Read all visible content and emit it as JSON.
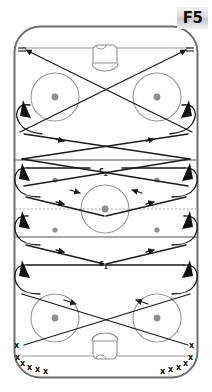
{
  "diagram": {
    "title": "F5",
    "kind": "ice-hockey-drill-diagram",
    "badge_label": "F5",
    "labels": {
      "c1_text": "c",
      "c1_sub": "1",
      "c2_text": "c",
      "c2_sub": "2"
    },
    "colors": {
      "boards": "#6e6e6e",
      "blue_line": "#8a8a8a",
      "red_line": "#9a9a9a",
      "goal_line": "#9a9a9a",
      "circle": "#9a9a9a",
      "dot": "#8f8f8f",
      "path": "#1a1a1a",
      "badge_text": "#0d0d0d",
      "background": "#ffffff"
    },
    "rink": {
      "left": 14,
      "top": 26,
      "right": 198,
      "bottom": 378,
      "corner_radius": 26,
      "goal_line_top_y": 48,
      "goal_line_bottom_y": 356,
      "blue_line_top_y": 160,
      "blue_line_bottom_y": 237,
      "center_line_y": 209
    },
    "faceoff_circles": [
      {
        "name": "top-left",
        "cx": 55,
        "cy": 97,
        "r": 24
      },
      {
        "name": "top-right",
        "cx": 157,
        "cy": 97,
        "r": 24
      },
      {
        "name": "center",
        "cx": 105,
        "cy": 209,
        "r": 24
      },
      {
        "name": "bottom-left",
        "cx": 55,
        "cy": 318,
        "r": 24
      },
      {
        "name": "bottom-right",
        "cx": 157,
        "cy": 318,
        "r": 24
      }
    ],
    "neutral_zone_dots": [
      {
        "cx": 55,
        "cy": 180
      },
      {
        "cx": 157,
        "cy": 180
      },
      {
        "cx": 55,
        "cy": 230
      },
      {
        "cx": 157,
        "cy": 230
      }
    ],
    "equal_markers": [
      {
        "name": "top-left-equals",
        "x": 18,
        "y": 50
      },
      {
        "name": "top-right-equals",
        "x": 186,
        "y": 50
      }
    ],
    "player_queue_left": [
      {
        "x": 17,
        "y": 349
      },
      {
        "x": 18,
        "y": 360
      },
      {
        "x": 23,
        "y": 366
      },
      {
        "x": 30,
        "y": 370
      },
      {
        "x": 38,
        "y": 372
      },
      {
        "x": 46,
        "y": 374
      }
    ],
    "player_queue_right": [
      {
        "x": 193,
        "y": 349
      },
      {
        "x": 192,
        "y": 360
      },
      {
        "x": 187,
        "y": 366
      },
      {
        "x": 180,
        "y": 370
      },
      {
        "x": 172,
        "y": 372
      },
      {
        "x": 164,
        "y": 374
      }
    ],
    "queue_mark_glyph": "x",
    "net_top": {
      "cx": 105,
      "cy": 52,
      "w": 26,
      "h": 20
    },
    "net_bottom": {
      "cx": 105,
      "cy": 352,
      "w": 26,
      "h": 20
    }
  }
}
